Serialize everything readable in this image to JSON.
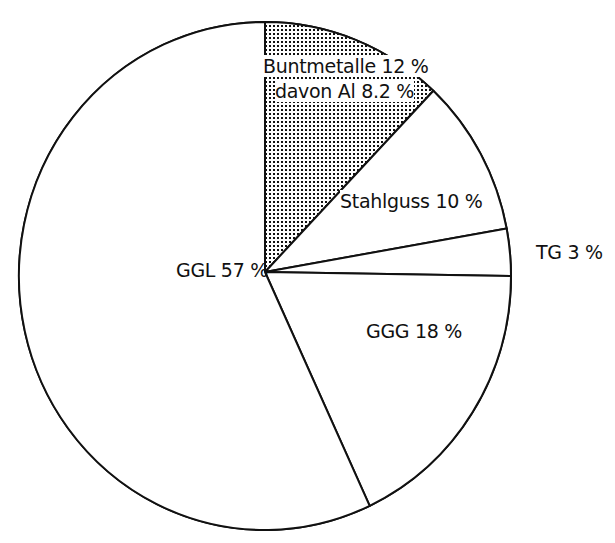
{
  "chart_data": {
    "type": "pie",
    "title": "",
    "start_angle_deg": 90,
    "direction": "clockwise",
    "slices": [
      {
        "name": "Buntmetalle",
        "value": 12,
        "label": "Buntmetalle 12 %",
        "sublabel": "davon Al 8.2 %",
        "fill": "dotted",
        "color": "#000000"
      },
      {
        "name": "Stahlguss",
        "value": 10,
        "label": "Stahlguss 10 %",
        "fill": "none",
        "color": "#ffffff"
      },
      {
        "name": "TG",
        "value": 3,
        "label": "TG 3 %",
        "fill": "none",
        "color": "#ffffff"
      },
      {
        "name": "GGG",
        "value": 18,
        "label": "GGG 18 %",
        "fill": "none",
        "color": "#ffffff"
      },
      {
        "name": "GGL",
        "value": 57,
        "label": "GGL 57 %",
        "fill": "none",
        "color": "#ffffff"
      }
    ],
    "categories": [
      "Buntmetalle",
      "Stahlguss",
      "TG",
      "GGG",
      "GGL"
    ],
    "values": [
      12,
      10,
      3,
      18,
      57
    ],
    "annotations": [
      "davon Al 8.2 %"
    ],
    "legend": "none",
    "units": "%"
  },
  "labels": {
    "buntmetalle": "Buntmetalle 12 %",
    "davon_al": "davon Al 8.2 %",
    "stahlguss": "Stahlguss 10 %",
    "tg": "TG 3 %",
    "ggg": "GGG 18 %",
    "ggl": "GGL 57 %"
  },
  "style": {
    "stroke": "#111111",
    "background": "#ffffff",
    "pattern_dot": "#111111"
  }
}
